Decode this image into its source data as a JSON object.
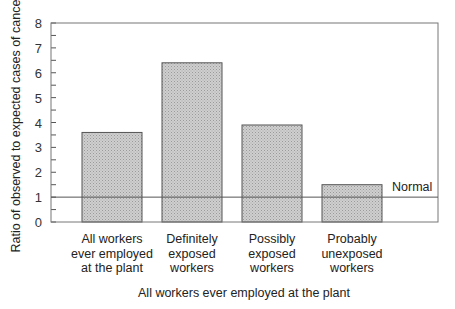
{
  "chart_data": {
    "type": "bar",
    "title": "",
    "xlabel": "All workers ever employed at the plant",
    "ylabel": "Ratio of observed to expected cases of cancer",
    "ylim": [
      0,
      8
    ],
    "yticks": [
      0,
      1,
      2,
      3,
      4,
      5,
      6,
      7,
      8
    ],
    "grid": false,
    "legend": null,
    "categories": [
      [
        "All  workers",
        "ever  employed",
        "at  the  plant"
      ],
      [
        "Definitely",
        "exposed",
        "workers"
      ],
      [
        "Possibly",
        "exposed",
        "workers"
      ],
      [
        "Probably",
        "unexposed",
        "workers"
      ]
    ],
    "category_names": [
      "All workers ever employed at the plant",
      "Definitely exposed workers",
      "Possibly exposed workers",
      "Probably unexposed workers"
    ],
    "values": [
      3.6,
      6.4,
      3.9,
      1.5
    ],
    "reference_line": {
      "value": 1,
      "label": "Normal"
    },
    "bar_fill": "#c4c4c4",
    "bar_edge": "#555555"
  }
}
